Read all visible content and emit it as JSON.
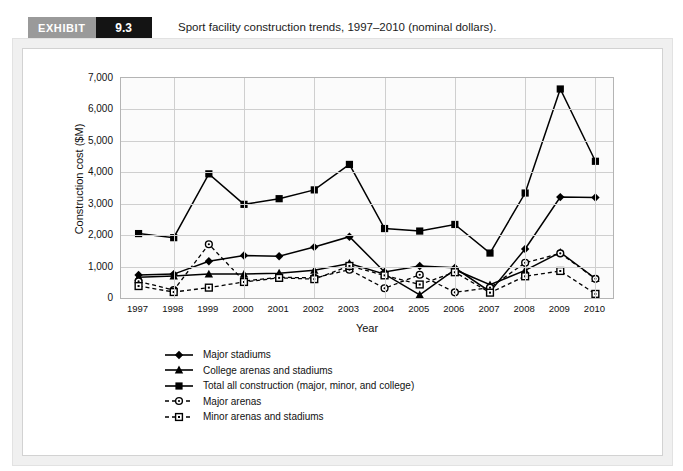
{
  "header": {
    "badge_word": "EXHIBIT",
    "badge_number": "9.3",
    "caption": "Sport facility construction trends, 1997–2010 (nominal dollars)."
  },
  "colors": {
    "badge_word_bg": "#9a9a9a",
    "badge_number_bg": "#141414",
    "series": "#000000",
    "grid": "#cfcfcf",
    "plot_bg": "#fbfbfb",
    "frame": "#b4b4b4"
  },
  "chart_data": {
    "type": "line",
    "title": "Sport facility construction trends, 1997–2010 (nominal dollars).",
    "xlabel": "Year",
    "ylabel": "Construction cost ($M)",
    "categories": [
      "1997",
      "1998",
      "1999",
      "2000",
      "2001",
      "2002",
      "2003",
      "2004",
      "2005",
      "2006",
      "2007",
      "2008",
      "2009",
      "2010"
    ],
    "x": [
      1997,
      1998,
      1999,
      2000,
      2001,
      2002,
      2003,
      2004,
      2005,
      2006,
      2007,
      2008,
      2009,
      2010
    ],
    "ylim": [
      0,
      7000
    ],
    "yticks": [
      "0",
      "1,000",
      "2,000",
      "3,000",
      "4,000",
      "5,000",
      "6,000",
      "7,000"
    ],
    "ytick_values": [
      0,
      1000,
      2000,
      3000,
      4000,
      5000,
      6000,
      7000
    ],
    "grid": true,
    "legend_position": "below-plot",
    "series": [
      {
        "name": "Major stadiums",
        "marker": "filled-diamond",
        "linestyle": "solid",
        "values": [
          730,
          760,
          1170,
          1350,
          1330,
          1620,
          1950,
          830,
          1020,
          960,
          200,
          1560,
          3210,
          3200
        ]
      },
      {
        "name": "College arenas and stadiums",
        "marker": "filled-triangle",
        "linestyle": "solid",
        "values": [
          660,
          700,
          760,
          760,
          790,
          880,
          1100,
          760,
          100,
          900,
          420,
          880,
          1450,
          620
        ]
      },
      {
        "name": "Total all construction (major, minor, and college)",
        "marker": "filled-square",
        "linestyle": "solid",
        "values": [
          2050,
          1920,
          3950,
          2980,
          3160,
          3440,
          4250,
          2210,
          2130,
          2340,
          1430,
          3340,
          6650,
          4350
        ]
      },
      {
        "name": "Major arenas",
        "marker": "open-circle",
        "linestyle": "dashed",
        "values": [
          530,
          250,
          1710,
          540,
          660,
          640,
          900,
          310,
          740,
          180,
          330,
          1120,
          1420,
          610
        ]
      },
      {
        "name": "Minor arenas and stadiums",
        "marker": "open-square",
        "linestyle": "dashed",
        "values": [
          380,
          190,
          330,
          510,
          640,
          600,
          1020,
          720,
          430,
          820,
          170,
          690,
          860,
          130
        ]
      }
    ]
  }
}
